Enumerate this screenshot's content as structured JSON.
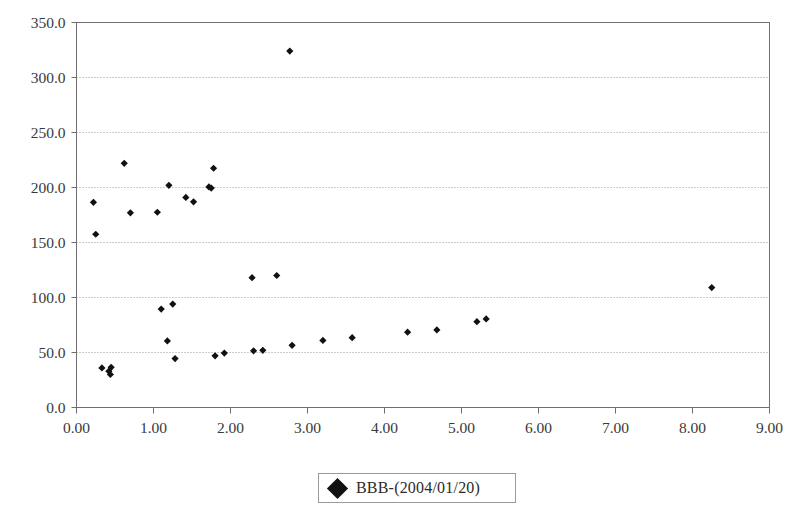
{
  "chart_data": {
    "type": "scatter",
    "title": "",
    "xlabel": "",
    "ylabel": "",
    "xlim": [
      0.0,
      9.0
    ],
    "ylim": [
      0.0,
      350.0
    ],
    "xticks": [
      "0.00",
      "1.00",
      "2.00",
      "3.00",
      "4.00",
      "5.00",
      "6.00",
      "7.00",
      "8.00",
      "9.00"
    ],
    "yticks": [
      "0.0",
      "50.0",
      "100.0",
      "150.0",
      "200.0",
      "250.0",
      "300.0",
      "350.0"
    ],
    "xtick_values": [
      0,
      1,
      2,
      3,
      4,
      5,
      6,
      7,
      8,
      9
    ],
    "ytick_values": [
      0,
      50,
      100,
      150,
      200,
      250,
      300,
      350
    ],
    "grid": "horizontal-dotted",
    "legend_position": "bottom-center",
    "marker": "filled-diamond",
    "marker_color": "#111111",
    "series": [
      {
        "name": "BBB-(2004/01/20)",
        "points": [
          [
            0.22,
            186.5
          ],
          [
            0.25,
            157.5
          ],
          [
            0.33,
            36.0
          ],
          [
            0.42,
            33.0
          ],
          [
            0.44,
            30.0
          ],
          [
            0.45,
            36.5
          ],
          [
            0.62,
            222.0
          ],
          [
            0.7,
            177.0
          ],
          [
            1.05,
            177.5
          ],
          [
            1.1,
            89.5
          ],
          [
            1.18,
            60.5
          ],
          [
            1.2,
            202.0
          ],
          [
            1.25,
            94.0
          ],
          [
            1.28,
            44.5
          ],
          [
            1.42,
            191.0
          ],
          [
            1.52,
            187.0
          ],
          [
            1.72,
            200.5
          ],
          [
            1.75,
            199.5
          ],
          [
            1.78,
            217.5
          ],
          [
            1.8,
            47.0
          ],
          [
            1.92,
            49.5
          ],
          [
            2.28,
            118.0
          ],
          [
            2.3,
            51.5
          ],
          [
            2.42,
            52.0
          ],
          [
            2.6,
            120.0
          ],
          [
            2.77,
            324.0
          ],
          [
            2.8,
            56.5
          ],
          [
            3.2,
            61.0
          ],
          [
            3.58,
            63.5
          ],
          [
            4.3,
            68.5
          ],
          [
            4.68,
            70.5
          ],
          [
            5.2,
            78.0
          ],
          [
            5.32,
            80.5
          ],
          [
            8.25,
            109.0
          ]
        ]
      }
    ]
  },
  "legend": {
    "label": "BBB-(2004/01/20)",
    "marker_name": "diamond-marker"
  }
}
